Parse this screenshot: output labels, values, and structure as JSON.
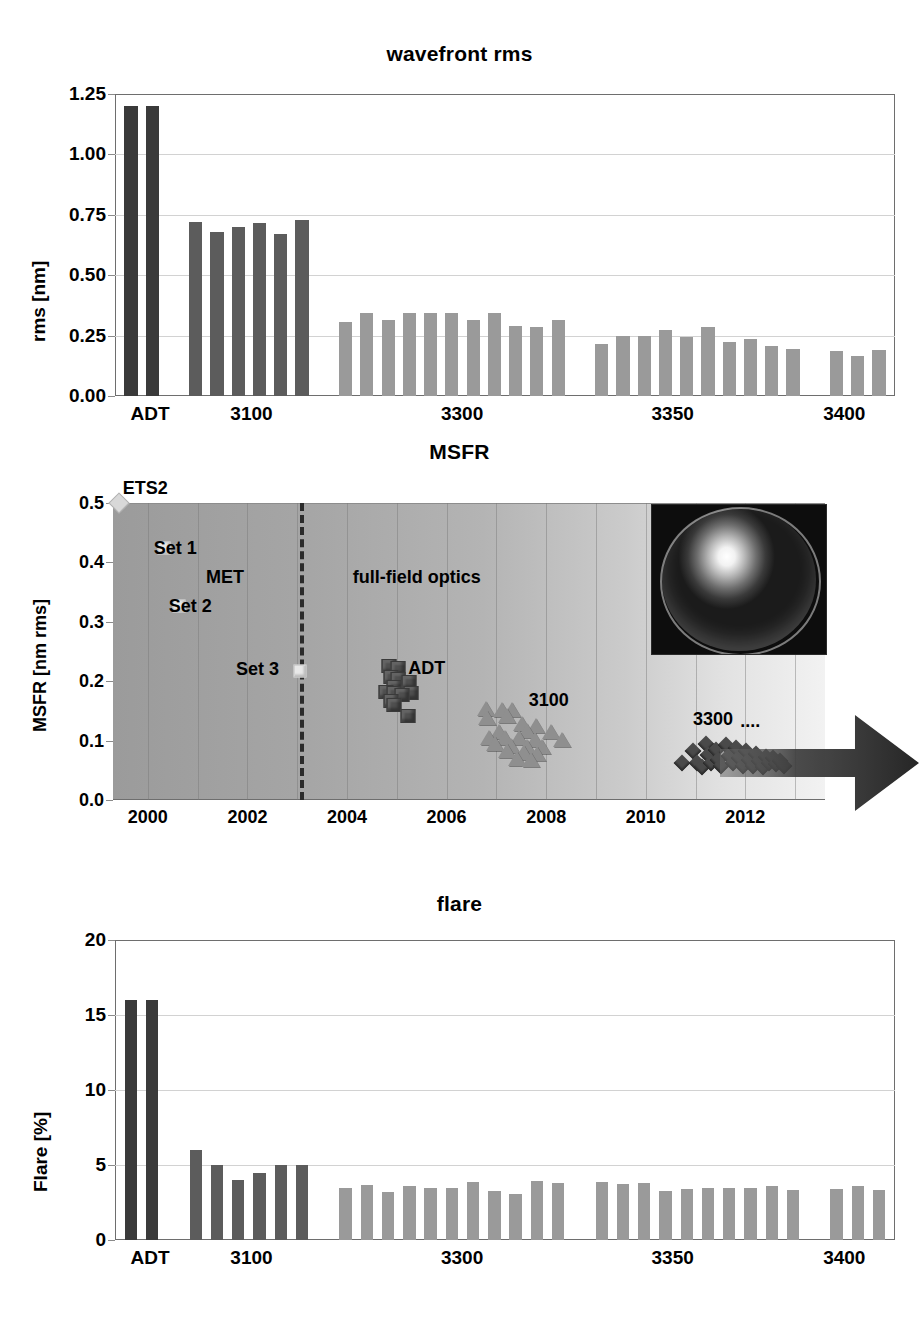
{
  "figure": {
    "panels": [
      "wavefront rms",
      "MSFR",
      "flare"
    ]
  },
  "chart_data": [
    {
      "type": "bar",
      "title": "wavefront rms",
      "xlabel": "",
      "ylabel": "rms [nm]",
      "ylim": [
        0,
        1.25
      ],
      "yticks": [
        "0.00",
        "0.25",
        "0.50",
        "0.75",
        "1.00",
        "1.25"
      ],
      "ytick_values": [
        0,
        0.25,
        0.5,
        0.75,
        1.0,
        1.25
      ],
      "grid": "horizontal",
      "xtick_labels": [
        "ADT",
        "3100",
        "3300",
        "3350",
        "3400"
      ],
      "groups": [
        {
          "name": "ADT",
          "shade": "dark",
          "values": [
            1.2,
            1.2
          ]
        },
        {
          "name": "3100",
          "shade": "mid",
          "values": [
            0.72,
            0.68,
            0.7,
            0.715,
            0.67,
            0.73
          ]
        },
        {
          "name": "3300",
          "shade": "light",
          "values": [
            0.305,
            0.345,
            0.315,
            0.345,
            0.345,
            0.345,
            0.315,
            0.345,
            0.29,
            0.285,
            0.315
          ]
        },
        {
          "name": "3350",
          "shade": "light",
          "values": [
            0.215,
            0.248,
            0.248,
            0.275,
            0.245,
            0.285,
            0.225,
            0.235,
            0.205,
            0.195
          ]
        },
        {
          "name": "3400",
          "shade": "light",
          "values": [
            0.185,
            0.165,
            0.19
          ]
        }
      ]
    },
    {
      "type": "scatter",
      "title": "MSFR",
      "xlabel": "",
      "ylabel": "MSFR [nm rms]",
      "xlim": [
        1999.3,
        2013.6
      ],
      "ylim": [
        0.0,
        0.5
      ],
      "yticks": [
        "0.0",
        "0.1",
        "0.2",
        "0.3",
        "0.4",
        "0.5"
      ],
      "ytick_values": [
        0.0,
        0.1,
        0.2,
        0.3,
        0.4,
        0.5
      ],
      "xticks": [
        "2000",
        "2002",
        "2004",
        "2006",
        "2008",
        "2010",
        "2012"
      ],
      "xtick_values": [
        2000,
        2002,
        2004,
        2006,
        2008,
        2010,
        2012
      ],
      "grid": "vertical",
      "annotations": [
        {
          "text": "ETS2",
          "x": 1999.95,
          "y": 0.525
        },
        {
          "text": "Set 1",
          "x": 2000.55,
          "y": 0.425
        },
        {
          "text": "MET",
          "x": 2001.55,
          "y": 0.375
        },
        {
          "text": "Set 2",
          "x": 2000.85,
          "y": 0.327
        },
        {
          "text": "Set 3",
          "x": 2002.2,
          "y": 0.22
        },
        {
          "text": "full-field optics",
          "x": 2005.4,
          "y": 0.375
        },
        {
          "text": "ADT",
          "x": 2005.6,
          "y": 0.222
        },
        {
          "text": "3100",
          "x": 2008.05,
          "y": 0.168
        },
        {
          "text": "3300",
          "x": 2011.35,
          "y": 0.137
        },
        {
          "text": "....",
          "x": 2012.1,
          "y": 0.133
        }
      ],
      "separator": {
        "type": "dashed-vertical",
        "x": 2003.05
      },
      "series": [
        {
          "name": "ETS2",
          "marker": "diamond-light",
          "points": [
            [
              1999.42,
              0.5
            ]
          ]
        },
        {
          "name": "MET sets",
          "marker": "square-light",
          "points": [
            [
              2000.32,
              0.425
            ],
            [
              2000.62,
              0.327
            ],
            [
              2003.05,
              0.218
            ]
          ]
        },
        {
          "name": "ADT",
          "marker": "cube-dark",
          "points": [
            [
              2004.85,
              0.226
            ],
            [
              2005.02,
              0.222
            ],
            [
              2004.88,
              0.207
            ],
            [
              2005.02,
              0.203
            ],
            [
              2005.25,
              0.198
            ],
            [
              2004.95,
              0.19
            ],
            [
              2004.78,
              0.182
            ],
            [
              2004.95,
              0.18
            ],
            [
              2005.28,
              0.18
            ],
            [
              2005.1,
              0.176
            ],
            [
              2004.88,
              0.166
            ],
            [
              2004.95,
              0.16
            ],
            [
              2005.22,
              0.142
            ]
          ]
        },
        {
          "name": "3100",
          "marker": "triangle-gray",
          "points": [
            [
              2006.8,
              0.152
            ],
            [
              2007.12,
              0.15
            ],
            [
              2007.32,
              0.15
            ],
            [
              2007.22,
              0.14
            ],
            [
              2006.82,
              0.137
            ],
            [
              2007.52,
              0.127
            ],
            [
              2007.8,
              0.123
            ],
            [
              2007.62,
              0.115
            ],
            [
              2007.05,
              0.112
            ],
            [
              2008.1,
              0.112
            ],
            [
              2006.85,
              0.103
            ],
            [
              2007.18,
              0.102
            ],
            [
              2007.45,
              0.102
            ],
            [
              2007.78,
              0.1
            ],
            [
              2008.32,
              0.1
            ],
            [
              2006.98,
              0.092
            ],
            [
              2007.3,
              0.09
            ],
            [
              2007.62,
              0.088
            ],
            [
              2007.92,
              0.088
            ],
            [
              2007.22,
              0.08
            ],
            [
              2007.55,
              0.078
            ],
            [
              2007.82,
              0.075
            ],
            [
              2007.42,
              0.068
            ],
            [
              2007.7,
              0.066
            ]
          ]
        },
        {
          "name": "3300",
          "marker": "diamond-dark",
          "points": [
            [
              2010.72,
              0.062
            ],
            [
              2010.95,
              0.082
            ],
            [
              2011.02,
              0.062
            ],
            [
              2011.12,
              0.055
            ],
            [
              2011.22,
              0.095
            ],
            [
              2011.25,
              0.075
            ],
            [
              2011.32,
              0.062
            ],
            [
              2011.42,
              0.085
            ],
            [
              2011.45,
              0.068
            ],
            [
              2011.52,
              0.058
            ],
            [
              2011.62,
              0.092
            ],
            [
              2011.68,
              0.074
            ],
            [
              2011.75,
              0.062
            ],
            [
              2011.82,
              0.088
            ],
            [
              2011.88,
              0.07
            ],
            [
              2011.95,
              0.058
            ],
            [
              2012.02,
              0.082
            ],
            [
              2012.08,
              0.068
            ],
            [
              2012.15,
              0.058
            ],
            [
              2012.22,
              0.078
            ],
            [
              2012.28,
              0.065
            ],
            [
              2012.35,
              0.055
            ],
            [
              2012.42,
              0.072
            ],
            [
              2012.48,
              0.062
            ],
            [
              2012.55,
              0.07
            ],
            [
              2012.62,
              0.06
            ],
            [
              2012.7,
              0.066
            ],
            [
              2012.78,
              0.058
            ]
          ]
        }
      ],
      "inset": {
        "name": "optic-photo",
        "x": 2010.1,
        "y_top": 0.498,
        "y_bottom": 0.248
      },
      "arrow": {
        "direction": "right",
        "y": 0.063
      }
    },
    {
      "type": "bar",
      "title": "flare",
      "xlabel": "",
      "ylabel": "Flare [%]",
      "ylim": [
        0,
        20
      ],
      "yticks": [
        "0",
        "5",
        "10",
        "15",
        "20"
      ],
      "ytick_values": [
        0,
        5,
        10,
        15,
        20
      ],
      "grid": "horizontal",
      "xtick_labels": [
        "ADT",
        "3100",
        "3300",
        "3350",
        "3400"
      ],
      "groups": [
        {
          "name": "ADT",
          "shade": "dark",
          "values": [
            16.0,
            16.0
          ]
        },
        {
          "name": "3100",
          "shade": "mid",
          "values": [
            6.0,
            5.0,
            4.0,
            4.5,
            5.0,
            5.0
          ]
        },
        {
          "name": "3300",
          "shade": "light",
          "values": [
            3.5,
            3.7,
            3.2,
            3.6,
            3.45,
            3.5,
            3.9,
            3.3,
            3.1,
            3.95,
            3.8
          ]
        },
        {
          "name": "3350",
          "shade": "light",
          "values": [
            3.85,
            3.75,
            3.8,
            3.3,
            3.4,
            3.45,
            3.45,
            3.45,
            3.6,
            3.35
          ]
        },
        {
          "name": "3400",
          "shade": "light",
          "values": [
            3.4,
            3.6,
            3.35
          ]
        }
      ]
    }
  ],
  "colors": {
    "bar_dark": "#3a3a3a",
    "bar_mid": "#5c5c5c",
    "bar_light": "#9a9a9a",
    "axis": "#6e6e6e",
    "grid": "#d2d2d2",
    "text": "#000000"
  }
}
